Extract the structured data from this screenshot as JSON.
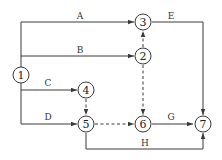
{
  "diagram": {
    "type": "activity-on-arrow network",
    "nodes": [
      {
        "id": "1",
        "label": "1"
      },
      {
        "id": "2",
        "label": "2"
      },
      {
        "id": "3",
        "label": "3"
      },
      {
        "id": "4",
        "label": "4"
      },
      {
        "id": "5",
        "label": "5"
      },
      {
        "id": "6",
        "label": "6"
      },
      {
        "id": "7",
        "label": "7"
      }
    ],
    "activities": [
      {
        "label": "A",
        "from": "1",
        "to": "3",
        "dummy": false
      },
      {
        "label": "B",
        "from": "1",
        "to": "2",
        "dummy": false
      },
      {
        "label": "C",
        "from": "1",
        "to": "4",
        "dummy": false
      },
      {
        "label": "D",
        "from": "1",
        "to": "5",
        "dummy": false
      },
      {
        "label": "E",
        "from": "3",
        "to": "7",
        "dummy": false
      },
      {
        "label": "G",
        "from": "6",
        "to": "7",
        "dummy": false
      },
      {
        "label": "H",
        "from": "5",
        "to": "7",
        "dummy": false
      }
    ],
    "dummy_activities": [
      {
        "from": "2",
        "to": "3"
      },
      {
        "from": "2",
        "to": "6"
      },
      {
        "from": "4",
        "to": "5"
      },
      {
        "from": "5",
        "to": "6"
      }
    ],
    "edge_labels": {
      "A": "A",
      "B": "B",
      "C": "C",
      "D": "D",
      "E": "E",
      "G": "G",
      "H": "H"
    }
  }
}
